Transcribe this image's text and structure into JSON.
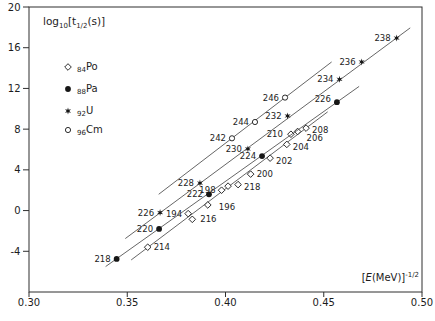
{
  "chart_data": {
    "type": "scatter",
    "title_parts": [
      "log",
      "10",
      "[t",
      "1/2",
      "(s)]"
    ],
    "xlabel_parts": {
      "open": "[",
      "E": "E",
      "rest": "(MeV)]",
      "sup": "-1/2"
    },
    "xlim": [
      0.3,
      0.5
    ],
    "ylim": [
      -8,
      20
    ],
    "grid": false,
    "legend_position": "upper-left-inside",
    "xticks": [
      {
        "v": 0.3,
        "label": "0.30"
      },
      {
        "v": 0.35,
        "label": "0.35"
      },
      {
        "v": 0.4,
        "label": "0.40"
      },
      {
        "v": 0.45,
        "label": "0.45"
      },
      {
        "v": 0.5,
        "label": "0.50"
      }
    ],
    "yticks": [
      {
        "v": -4,
        "label": "-4"
      },
      {
        "v": 0,
        "label": "0"
      },
      {
        "v": 4,
        "label": "4"
      },
      {
        "v": 8,
        "label": "8"
      },
      {
        "v": 12,
        "label": "12"
      },
      {
        "v": 16,
        "label": "16"
      },
      {
        "v": 20,
        "label": "20"
      }
    ],
    "legend": [
      {
        "marker": "diamond-open",
        "z": "84",
        "el": "Po"
      },
      {
        "marker": "circle-filled",
        "z": "88",
        "el": "Pa"
      },
      {
        "marker": "star",
        "z": "92",
        "el": "U"
      },
      {
        "marker": "circle-open",
        "z": "96",
        "el": "Cm"
      }
    ],
    "series": [
      {
        "name": "84Po",
        "marker": "diamond-open",
        "line": {
          "x1": 0.352,
          "y1": -4.85,
          "x2": 0.452,
          "y2": 9.7
        },
        "points": [
          {
            "label": "194",
            "x": 0.381,
            "y": -0.3,
            "side": "left"
          },
          {
            "label": "196",
            "x": 0.391,
            "y": 0.55,
            "side": "right",
            "dx": 5,
            "dy": 2
          },
          {
            "label": "198",
            "x": 0.398,
            "y": 2.0,
            "side": "left"
          },
          {
            "label": "",
            "x": 0.4013,
            "y": 2.4
          },
          {
            "label": "218",
            "x": 0.4064,
            "y": 2.55,
            "side": "right",
            "dy": 2
          },
          {
            "label": "200",
            "x": 0.4128,
            "y": 3.58,
            "side": "right"
          },
          {
            "label": "202",
            "x": 0.4227,
            "y": 5.15,
            "side": "right",
            "dy": 3
          },
          {
            "label": "204",
            "x": 0.4312,
            "y": 6.5,
            "side": "right",
            "dy": 3
          },
          {
            "label": "210",
            "x": 0.4333,
            "y": 7.5,
            "side": "left",
            "dx": -2
          },
          {
            "label": "206",
            "x": 0.4367,
            "y": 7.77,
            "side": "right",
            "dx": 3,
            "dy": 7
          },
          {
            "label": "208",
            "x": 0.441,
            "y": 8.1,
            "side": "right",
            "dy": 2
          },
          {
            "label": "214",
            "x": 0.3604,
            "y": -3.6,
            "side": "right"
          },
          {
            "label": "216",
            "x": 0.3831,
            "y": -0.86,
            "side": "right",
            "dx": 2
          }
        ]
      },
      {
        "name": "88Pa",
        "marker": "circle-filled",
        "line": {
          "x1": 0.339,
          "y1": -5.5,
          "x2": 0.468,
          "y2": 12.2
        },
        "points": [
          {
            "label": "218",
            "x": 0.3446,
            "y": -4.75,
            "side": "left"
          },
          {
            "label": "220",
            "x": 0.3662,
            "y": -1.8,
            "side": "left"
          },
          {
            "label": "222",
            "x": 0.3916,
            "y": 1.6,
            "side": "left"
          },
          {
            "label": "224",
            "x": 0.4186,
            "y": 5.35,
            "side": "left"
          },
          {
            "label": "226",
            "x": 0.4567,
            "y": 10.65,
            "side": "left",
            "dy": -3
          }
        ]
      },
      {
        "name": "92U",
        "marker": "star",
        "line": {
          "x1": 0.349,
          "y1": -2.75,
          "x2": 0.494,
          "y2": 17.95
        },
        "points": [
          {
            "label": "226",
            "x": 0.3667,
            "y": -0.2,
            "side": "left"
          },
          {
            "label": "228",
            "x": 0.387,
            "y": 2.7,
            "side": "left"
          },
          {
            "label": "230",
            "x": 0.4114,
            "y": 6.05,
            "side": "left"
          },
          {
            "label": "232",
            "x": 0.4316,
            "y": 9.3,
            "side": "left"
          },
          {
            "label": "234",
            "x": 0.458,
            "y": 12.9,
            "side": "left"
          },
          {
            "label": "236",
            "x": 0.4693,
            "y": 14.6,
            "side": "left"
          },
          {
            "label": "238",
            "x": 0.4871,
            "y": 16.95,
            "side": "left"
          }
        ]
      },
      {
        "name": "96Cm",
        "marker": "circle-open",
        "line": {
          "x1": 0.366,
          "y1": 1.6,
          "x2": 0.454,
          "y2": 14.6
        },
        "points": [
          {
            "label": "242",
            "x": 0.4033,
            "y": 7.1,
            "side": "left"
          },
          {
            "label": "244",
            "x": 0.415,
            "y": 8.7,
            "side": "left"
          },
          {
            "label": "246",
            "x": 0.4303,
            "y": 11.1,
            "side": "left"
          }
        ]
      }
    ],
    "colors": {
      "frame": "#2f2f2f",
      "line": "#4a4a4a",
      "marker": "#161616",
      "text": "#1c1c1c",
      "bg": "#ffffff"
    }
  }
}
